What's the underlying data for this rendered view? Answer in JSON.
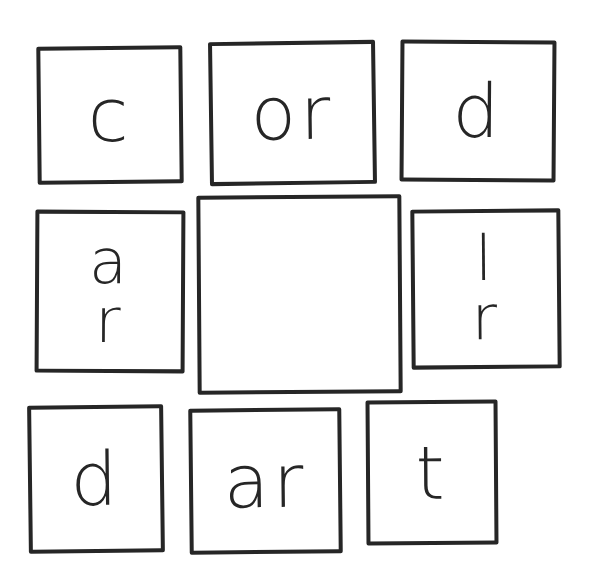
{
  "puzzle": {
    "type": "word-square-grid",
    "tiles": {
      "top_left": "c",
      "top_center": "or",
      "top_right": "d",
      "middle_left": [
        "a",
        "r"
      ],
      "center": "",
      "middle_right": [
        "l",
        "r"
      ],
      "bottom_left": "d",
      "bottom_center": "ar",
      "bottom_right": "t"
    },
    "stroke_color": "#262626",
    "background_color": "#ffffff"
  }
}
